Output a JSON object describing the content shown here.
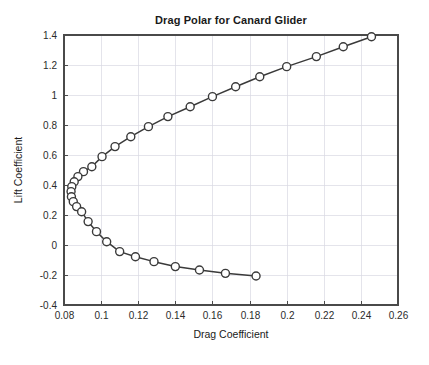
{
  "chart_data": {
    "type": "line",
    "title": "Drag Polar for Canard Glider",
    "xlabel": "Drag Coefficient",
    "ylabel": "Lift Coefficient",
    "xlim": [
      0.08,
      0.26
    ],
    "ylim": [
      -0.4,
      1.4
    ],
    "xticks": [
      0.08,
      0.1,
      0.12,
      0.14,
      0.16,
      0.18,
      0.2,
      0.22,
      0.24,
      0.26
    ],
    "xticklabels": [
      "0.08",
      "0.1",
      "0.12",
      "0.14",
      "0.16",
      "0.18",
      "0.2",
      "0.22",
      "0.24",
      "0.26"
    ],
    "yticks": [
      -0.4,
      -0.2,
      0,
      0.2,
      0.4,
      0.6,
      0.8,
      1,
      1.2,
      1.4
    ],
    "yticklabels": [
      "-0.4",
      "-0.2",
      "0",
      "0.2",
      "0.4",
      "0.6",
      "0.8",
      "1",
      "1.2",
      "1.4"
    ],
    "grid": true,
    "legend": null,
    "marker": "open-circle",
    "line_color": "#3a3a3a",
    "marker_face_color": "#ffffff",
    "grid_color": "#d8d8e2",
    "series": [
      {
        "name": "drag polar",
        "x": [
          0.2457,
          0.2305,
          0.216,
          0.2,
          0.1855,
          0.1725,
          0.16,
          0.148,
          0.136,
          0.1255,
          0.116,
          0.1075,
          0.1005,
          0.095,
          0.0905,
          0.0875,
          0.0855,
          0.0842,
          0.0838,
          0.084,
          0.085,
          0.0868,
          0.0895,
          0.093,
          0.0975,
          0.103,
          0.11,
          0.1185,
          0.1285,
          0.14,
          0.153,
          0.167,
          0.1835
        ],
        "y": [
          1.388,
          1.322,
          1.256,
          1.189,
          1.122,
          1.055,
          0.989,
          0.922,
          0.856,
          0.789,
          0.722,
          0.656,
          0.589,
          0.522,
          0.489,
          0.456,
          0.422,
          0.389,
          0.356,
          0.322,
          0.289,
          0.256,
          0.222,
          0.156,
          0.089,
          0.022,
          -0.044,
          -0.078,
          -0.111,
          -0.144,
          -0.167,
          -0.189,
          -0.2065
        ]
      }
    ]
  }
}
